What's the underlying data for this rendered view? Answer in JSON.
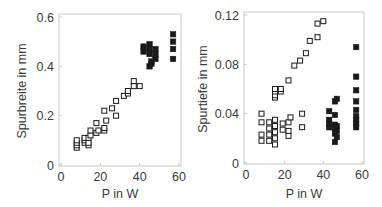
{
  "chart_data": [
    {
      "type": "scatter",
      "title": "",
      "xlabel": "P in W",
      "ylabel": "Spurbreite in mm",
      "xlim": [
        0,
        60
      ],
      "ylim": [
        0,
        0.6
      ],
      "xticks": [
        "0",
        "20",
        "40",
        "60"
      ],
      "yticks": [
        "0",
        "0.2",
        "0.4",
        "0.6"
      ],
      "grid": false,
      "legend": null,
      "series": [
        {
          "name": "open",
          "marker": "open-square",
          "points": [
            [
              8,
              0.07
            ],
            [
              8,
              0.08
            ],
            [
              8,
              0.09
            ],
            [
              8,
              0.1
            ],
            [
              12,
              0.09
            ],
            [
              12,
              0.1
            ],
            [
              12,
              0.11
            ],
            [
              14,
              0.08
            ],
            [
              14,
              0.09
            ],
            [
              14,
              0.11
            ],
            [
              15,
              0.12
            ],
            [
              15,
              0.14
            ],
            [
              18,
              0.13
            ],
            [
              18,
              0.17
            ],
            [
              19,
              0.14
            ],
            [
              22,
              0.14
            ],
            [
              22,
              0.15
            ],
            [
              22,
              0.22
            ],
            [
              23,
              0.18
            ],
            [
              26,
              0.23
            ],
            [
              28,
              0.2
            ],
            [
              28,
              0.26
            ],
            [
              32,
              0.28
            ],
            [
              34,
              0.29
            ],
            [
              34,
              0.3
            ],
            [
              37,
              0.32
            ],
            [
              37,
              0.34
            ],
            [
              40,
              0.32
            ]
          ]
        },
        {
          "name": "filled",
          "marker": "filled-square",
          "points": [
            [
              42,
              0.46
            ],
            [
              42,
              0.48
            ],
            [
              45,
              0.4
            ],
            [
              45,
              0.45
            ],
            [
              45,
              0.47
            ],
            [
              45,
              0.49
            ],
            [
              46,
              0.41
            ],
            [
              46,
              0.42
            ],
            [
              48,
              0.43
            ],
            [
              48,
              0.45
            ],
            [
              48,
              0.47
            ],
            [
              57,
              0.43
            ],
            [
              57,
              0.47
            ],
            [
              57,
              0.5
            ],
            [
              57,
              0.53
            ]
          ]
        }
      ]
    },
    {
      "type": "scatter",
      "title": "",
      "xlabel": "P in W",
      "ylabel": "Spurtiefe in mm",
      "xlim": [
        0,
        60
      ],
      "ylim": [
        0,
        0.12
      ],
      "xticks": [
        "0",
        "20",
        "40",
        "60"
      ],
      "yticks": [
        "0",
        "0.04",
        "0.08",
        "0.12"
      ],
      "grid": false,
      "legend": null,
      "series": [
        {
          "name": "open",
          "marker": "open-square",
          "points": [
            [
              8,
              0.018
            ],
            [
              8,
              0.023
            ],
            [
              8,
              0.033
            ],
            [
              8,
              0.04
            ],
            [
              12,
              0.018
            ],
            [
              12,
              0.023
            ],
            [
              12,
              0.028
            ],
            [
              12,
              0.033
            ],
            [
              15,
              0.015
            ],
            [
              15,
              0.02
            ],
            [
              15,
              0.025
            ],
            [
              15,
              0.03
            ],
            [
              15,
              0.035
            ],
            [
              15,
              0.053
            ],
            [
              15,
              0.055
            ],
            [
              15,
              0.058
            ],
            [
              15,
              0.06
            ],
            [
              18,
              0.058
            ],
            [
              18,
              0.06
            ],
            [
              19,
              0.027
            ],
            [
              19,
              0.032
            ],
            [
              22,
              0.022
            ],
            [
              22,
              0.026
            ],
            [
              22,
              0.033
            ],
            [
              22,
              0.067
            ],
            [
              23,
              0.037
            ],
            [
              25,
              0.079
            ],
            [
              28,
              0.083
            ],
            [
              29,
              0.029
            ],
            [
              29,
              0.04
            ],
            [
              31,
              0.089
            ],
            [
              33,
              0.099
            ],
            [
              37,
              0.102
            ],
            [
              37,
              0.113
            ],
            [
              40,
              0.115
            ]
          ]
        },
        {
          "name": "filled",
          "marker": "filled-square",
          "points": [
            [
              43,
              0.029
            ],
            [
              43,
              0.032
            ],
            [
              43,
              0.035
            ],
            [
              43,
              0.042
            ],
            [
              46,
              0.017
            ],
            [
              46,
              0.024
            ],
            [
              46,
              0.028
            ],
            [
              46,
              0.031
            ],
            [
              46,
              0.039
            ],
            [
              46,
              0.05
            ],
            [
              47,
              0.021
            ],
            [
              47,
              0.026
            ],
            [
              47,
              0.03
            ],
            [
              47,
              0.052
            ],
            [
              57,
              0.029
            ],
            [
              57,
              0.032
            ],
            [
              57,
              0.035
            ],
            [
              57,
              0.038
            ],
            [
              57,
              0.043
            ],
            [
              57,
              0.05
            ],
            [
              57,
              0.059
            ],
            [
              57,
              0.07
            ],
            [
              57,
              0.094
            ]
          ]
        }
      ]
    }
  ],
  "charts": [
    {
      "ylabel": "Spurbreite in mm",
      "xlabel": "P in W"
    },
    {
      "ylabel": "Spurtiefe in mm",
      "xlabel": "P in W"
    }
  ],
  "colors": {
    "axis": "#c8c8c8",
    "text": "#3a3a3a",
    "marker": "#1a1a1a"
  }
}
